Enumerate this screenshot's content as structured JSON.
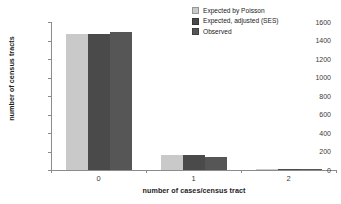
{
  "chart_data": {
    "type": "bar",
    "title": "",
    "subtitle": "",
    "xlabel": "number of cases/census tract",
    "ylabel": "number of census tracts",
    "categories": [
      "0",
      "1",
      "2"
    ],
    "series": [
      {
        "name": "Expected by Poisson",
        "color": "#c9c9c9",
        "values": [
          1470,
          160,
          4
        ]
      },
      {
        "name": "Expected, adjusted (SES)",
        "color": "#4a4a4a",
        "values": [
          1470,
          160,
          6
        ]
      },
      {
        "name": "Observed",
        "color": "#565656",
        "values": [
          1490,
          145,
          8
        ]
      }
    ],
    "ylim": [
      0,
      1600
    ],
    "yticks": [
      0,
      200,
      400,
      600,
      800,
      1000,
      1200,
      1400,
      1600
    ],
    "ytick_labels": [
      "0",
      "200",
      "400",
      "600",
      "800",
      "1000",
      "1200",
      "1400",
      "1600"
    ],
    "grid": false,
    "legend_position": "top-right"
  },
  "legend": {
    "items": [
      {
        "label": "Expected by Poisson",
        "swatch": "#c9c9c9"
      },
      {
        "label": "Expected, adjusted (SES)",
        "swatch": "#4a4a4a"
      },
      {
        "label": "Observed",
        "swatch": "#565656"
      }
    ]
  }
}
